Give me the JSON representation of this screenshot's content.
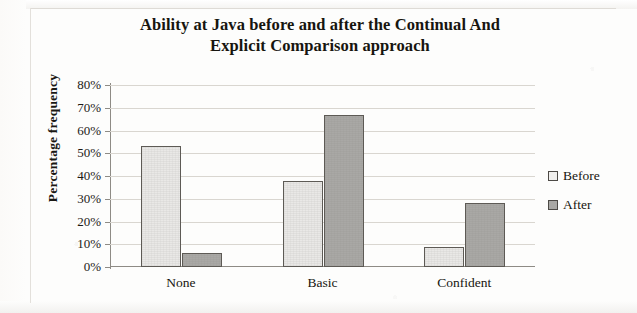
{
  "chart_data": {
    "type": "bar",
    "title": "Ability at Java before and after the Continual And Explicit Comparison approach",
    "title_line_1": "Ability at Java before and after the Continual And",
    "title_line_2": "Explicit Comparison approach",
    "xlabel": "",
    "ylabel": "Percentage frequency",
    "categories": [
      "None",
      "Basic",
      "Confident"
    ],
    "series": [
      {
        "name": "Before",
        "values": [
          53,
          38,
          9
        ],
        "color": "#e9e8e6"
      },
      {
        "name": "After",
        "values": [
          6,
          67,
          28
        ]
      }
    ],
    "ylim": [
      0,
      80
    ],
    "ytick_values": [
      80,
      70,
      60,
      50,
      40,
      30,
      20,
      10,
      0
    ],
    "ytick_labels": [
      "80%",
      "70%",
      "60%",
      "50%",
      "40%",
      "30%",
      "20%",
      "10%",
      "0%"
    ],
    "grid": true,
    "legend_position": "right",
    "colors": {
      "series_before": "#e9e8e6",
      "series_after": "#a9a8a5",
      "bar_border": "#5d5a55",
      "gridline": "#d9d6d0",
      "axis": "#8e8b85",
      "text": "#17150f",
      "background": "#fdfdfc"
    }
  }
}
